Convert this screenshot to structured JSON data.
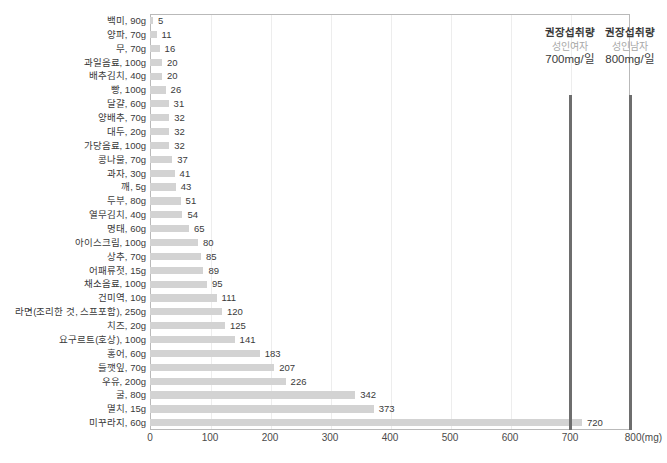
{
  "chart_data": {
    "type": "bar",
    "orientation": "horizontal",
    "title": "",
    "subtitle": "",
    "xlabel": "",
    "ylabel": "",
    "xlim": [
      0,
      800
    ],
    "xticks": [
      0,
      100,
      200,
      300,
      400,
      500,
      600,
      700,
      800
    ],
    "xtick_labels": [
      "0",
      "100",
      "200",
      "300",
      "400",
      "500",
      "600",
      "700",
      "800(mg)"
    ],
    "unit": "mg",
    "grid": true,
    "legend": "none",
    "bar_color": "#d3d3d3",
    "reference_line_color": "#6e6e6e",
    "categories": [
      "백미, 90g",
      "양파, 70g",
      "무, 70g",
      "과일음료, 100g",
      "배추김치, 40g",
      "빵, 100g",
      "달걀, 60g",
      "양배추, 70g",
      "대두, 20g",
      "가당음료, 100g",
      "콩나물, 70g",
      "과자, 30g",
      "깨, 5g",
      "두부, 80g",
      "열무김치, 40g",
      "명태, 60g",
      "아이스크림, 100g",
      "상추, 70g",
      "어패류젓, 15g",
      "채소음료, 100g",
      "건미역, 10g",
      "라면(조리한 것, 스프포함), 250g",
      "치즈, 20g",
      "요구르트(호상), 100g",
      "홍어, 60g",
      "들깻잎, 70g",
      "우유, 200g",
      "굴, 80g",
      "멸치, 15g",
      "미꾸라지, 60g"
    ],
    "values": [
      5,
      11,
      16,
      20,
      20,
      26,
      31,
      32,
      32,
      32,
      37,
      41,
      43,
      51,
      54,
      65,
      80,
      85,
      89,
      95,
      111,
      120,
      125,
      141,
      183,
      207,
      226,
      342,
      373,
      720
    ],
    "reference_lines": [
      {
        "value": 700,
        "title": "권장섭취량",
        "group": "성인여자",
        "amount": "700mg/일"
      },
      {
        "value": 800,
        "title": "권장섭취량",
        "group": "성인남자",
        "amount": "800mg/일"
      }
    ]
  }
}
